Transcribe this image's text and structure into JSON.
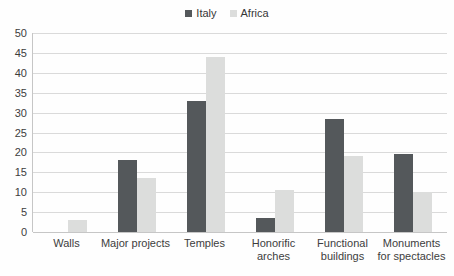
{
  "chart_data": {
    "type": "bar",
    "title": "",
    "xlabel": "",
    "ylabel": "",
    "categories": [
      "Walls",
      "Major projects",
      "Temples",
      "Honorific\narches",
      "Functional\nbuildings",
      "Monuments\nfor spectacles"
    ],
    "series": [
      {
        "name": "Italy",
        "color": "#54585b",
        "values": [
          0,
          18,
          33,
          3.5,
          28.5,
          19.5
        ]
      },
      {
        "name": "Africa",
        "color": "#dcdddc",
        "values": [
          3,
          13.5,
          44,
          10.5,
          19,
          10
        ]
      }
    ],
    "ylim": [
      0,
      50
    ],
    "y_ticks": [
      0,
      5,
      10,
      15,
      20,
      25,
      30,
      35,
      40,
      45,
      50
    ],
    "grid": true,
    "legend_position": "top-center",
    "colors": {
      "gridline": "#dadada",
      "axis_line": "#c6c6c6",
      "text": "#3d3d3d",
      "background": "#fefefe"
    }
  }
}
